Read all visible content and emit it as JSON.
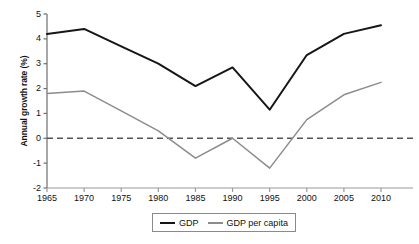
{
  "chart_data": {
    "type": "line",
    "title": "",
    "xlabel": "",
    "ylabel": "Annual growth rate (%)",
    "x": [
      1965,
      1970,
      1975,
      1980,
      1985,
      1990,
      1995,
      2000,
      2005,
      2010
    ],
    "xticks": [
      "1965",
      "1970",
      "1975",
      "1980",
      "1985",
      "1990",
      "1995",
      "2000",
      "2005",
      "2010"
    ],
    "yticks": [
      "5",
      "4",
      "3",
      "2",
      "1",
      "0",
      "-1",
      "-2"
    ],
    "ytick_values": [
      5,
      4,
      3,
      2,
      1,
      0,
      -1,
      -2
    ],
    "xlim": [
      1965,
      2010
    ],
    "ylim": [
      -2,
      5
    ],
    "grid": false,
    "zero_line": 0,
    "zero_line_style": "dashed",
    "legend_position": "bottom-center",
    "series": [
      {
        "name": "GDP",
        "color": "#161616",
        "values": [
          4.2,
          4.4,
          3.7,
          3.0,
          2.1,
          2.85,
          1.15,
          3.35,
          4.2,
          4.55
        ]
      },
      {
        "name": "GDP per capita",
        "color": "#8c8c8c",
        "values": [
          1.8,
          1.9,
          1.1,
          0.3,
          -0.8,
          0.0,
          -1.2,
          0.75,
          1.75,
          2.25
        ]
      }
    ]
  },
  "axis": {
    "y_title": "Annual growth rate (%)"
  },
  "legend": {
    "items": [
      {
        "label": "GDP"
      },
      {
        "label": "GDP per capita"
      }
    ]
  }
}
